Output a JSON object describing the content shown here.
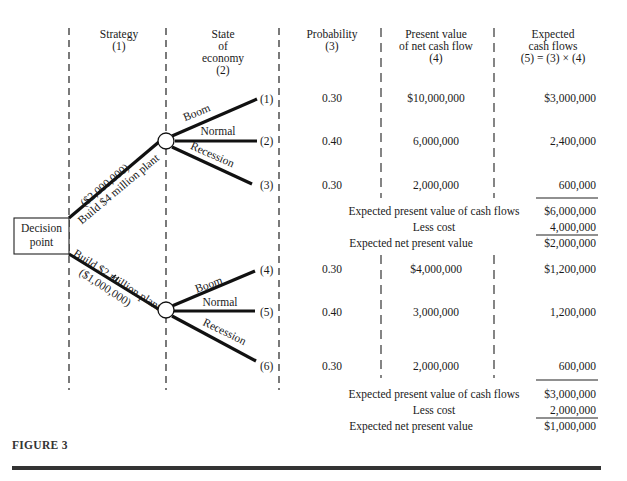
{
  "headers": {
    "strategy": [
      "Strategy",
      "(1)"
    ],
    "state": [
      "State",
      "of",
      "economy",
      "(2)"
    ],
    "probability": [
      "Probability",
      "(3)"
    ],
    "present_value": [
      "Present value",
      "of net cash flow",
      "(4)"
    ],
    "expected": [
      "Expected",
      "cash flows",
      "(5) = (3) × (4)"
    ]
  },
  "decision_point": [
    "Decision",
    "point"
  ],
  "strategies": [
    {
      "label": "Build $4 million plant",
      "cost_label": "($2,000,000)",
      "outcomes": [
        {
          "state": "Boom",
          "num": "(1)",
          "probability": "0.30",
          "present_value": "$10,000,000",
          "expected": "$3,000,000"
        },
        {
          "state": "Normal",
          "num": "(2)",
          "probability": "0.40",
          "present_value": "6,000,000",
          "expected": "2,400,000"
        },
        {
          "state": "Recession",
          "num": "(3)",
          "probability": "0.30",
          "present_value": "2,000,000",
          "expected": "600,000"
        }
      ],
      "summary": {
        "epv_label": "Expected present value of cash flows",
        "epv": "$6,000,000",
        "cost_label": "Less cost",
        "cost": "4,000,000",
        "npv_label": "Expected net present value",
        "npv": "$2,000,000"
      }
    },
    {
      "label": "Build $2 million plant",
      "cost_label": "($1,000,000)",
      "outcomes": [
        {
          "state": "Boom",
          "num": "(4)",
          "probability": "0.30",
          "present_value": "$4,000,000",
          "expected": "$1,200,000"
        },
        {
          "state": "Normal",
          "num": "(5)",
          "probability": "0.40",
          "present_value": "3,000,000",
          "expected": "1,200,000"
        },
        {
          "state": "Recession",
          "num": "(6)",
          "probability": "0.30",
          "present_value": "2,000,000",
          "expected": "600,000"
        }
      ],
      "summary": {
        "epv_label": "Expected present value of cash flows",
        "epv": "$3,000,000",
        "cost_label": "Less cost",
        "cost": "2,000,000",
        "npv_label": "Expected net present value",
        "npv": "$1,000,000"
      }
    }
  ],
  "figure_label": "FIGURE 3"
}
